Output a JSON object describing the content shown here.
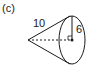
{
  "figure": {
    "part_label": "(c)",
    "shape": "cone",
    "slant_height_label": "10",
    "radius_label": "6",
    "height_line_style": "dashed",
    "right_angle_marker": true,
    "colors": {
      "stroke": "#1a1a1a",
      "background": "#ffffff"
    }
  }
}
